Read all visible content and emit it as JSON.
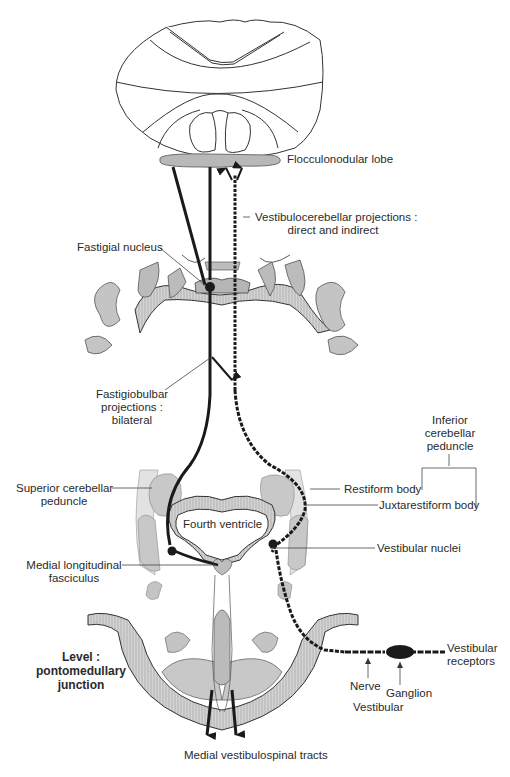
{
  "labels": {
    "flocculonodular_lobe": "Flocculonodular lobe",
    "vestibulocerebellar_line1": "Vestibulocerebellar projections :",
    "vestibulocerebellar_line2": "direct and indirect",
    "fastigial_nucleus": "Fastigial nucleus",
    "fastigiobulbar_line1": "Fastigiobulbar",
    "fastigiobulbar_line2": "projections :",
    "fastigiobulbar_line3": "bilateral",
    "inferior_cerebellar_line1": "Inferior",
    "inferior_cerebellar_line2": "cerebellar",
    "inferior_cerebellar_line3": "peduncle",
    "superior_cerebellar_line1": "Superior cerebellar",
    "superior_cerebellar_line2": "peduncle",
    "restiform_body": "Restiform body",
    "juxtarestiform_body": "Juxtarestiform body",
    "fourth_ventricle": "Fourth ventricle",
    "vestibular_nuclei": "Vestibular nuclei",
    "mlf_line1": "Medial longitudinal",
    "mlf_line2": "fasciculus",
    "level_line1": "Level :",
    "level_line2": "pontomedullary",
    "level_line3": "junction",
    "vestibular_receptors_line1": "Vestibular",
    "vestibular_receptors_line2": "receptors",
    "nerve": "Nerve",
    "ganglion": "Ganglion",
    "vestibular": "Vestibular",
    "medial_vestibulospinal_tracts": "Medial vestibulospinal tracts"
  },
  "colors": {
    "tract": "#1a1a1a",
    "tissue_gray": "#c9c9c9",
    "tissue_dark": "#a8a8a8",
    "outline": "#333333",
    "leader": "#444444"
  }
}
